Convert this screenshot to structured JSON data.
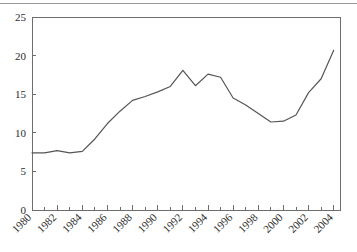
{
  "figure": {
    "background_color": "#ffffff",
    "top_rule_color": "#9a9a9a",
    "line_color": "#555555",
    "axis_color": "#6e6e6e",
    "text_color": "#2b2b2b"
  },
  "chart_data": {
    "type": "line",
    "title": "",
    "subtitle": "",
    "xlabel": "",
    "ylabel": "",
    "xlim": [
      1980,
      2004.5
    ],
    "ylim": [
      0,
      25
    ],
    "grid": false,
    "legend": null,
    "legend_position": "none",
    "y_ticks": [
      0,
      5,
      10,
      15,
      20,
      25
    ],
    "y_tick_labels": [
      "0",
      "5",
      "10",
      "15",
      "20",
      "25"
    ],
    "x_ticks": [
      1980,
      1982,
      1984,
      1986,
      1988,
      1990,
      1992,
      1994,
      1996,
      1998,
      2000,
      2002,
      2004
    ],
    "x_tick_labels": [
      "1980",
      "1982",
      "1984",
      "1986",
      "1988",
      "1990",
      "1992",
      "1994",
      "1996",
      "1998",
      "2000",
      "2002",
      "2004"
    ],
    "x_minor_ticks": [
      1981,
      1983,
      1985,
      1987,
      1989,
      1991,
      1993,
      1995,
      1997,
      1999,
      2001,
      2003
    ],
    "x_tick_label_rotation": -45,
    "x": [
      1980,
      1981,
      1982,
      1983,
      1984,
      1985,
      1986,
      1987,
      1988,
      1989,
      1990,
      1991,
      1992,
      1993,
      1994,
      1995,
      1996,
      1997,
      1998,
      1999,
      2000,
      2001,
      2002,
      2003,
      2004
    ],
    "values": [
      7.4,
      7.4,
      7.7,
      7.4,
      7.6,
      9.2,
      11.2,
      12.8,
      14.2,
      14.7,
      15.3,
      16.0,
      18.1,
      16.1,
      17.6,
      17.2,
      14.5,
      13.6,
      12.5,
      11.4,
      11.5,
      12.3,
      15.2,
      17.0,
      20.7
    ]
  }
}
